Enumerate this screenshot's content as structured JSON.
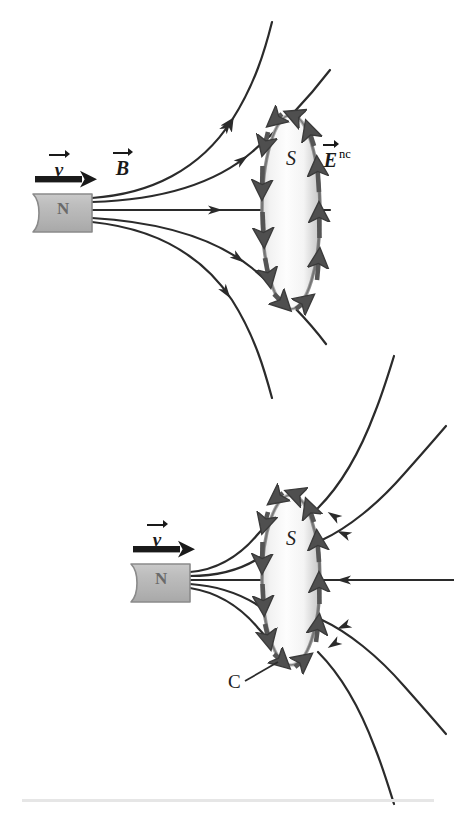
{
  "figure": {
    "background_color": "#ffffff",
    "ink_color": "#2b2b2b",
    "arrow_gray": "#5a5a5a",
    "magnet_fill": "#b8b8b8",
    "magnet_stroke": "#8a8a8a",
    "surface_fill_light": "#fbfbfb",
    "surface_fill_mid": "#e3e3e3",
    "surface_stroke": "#6f6f6f",
    "divider_color": "#e6e6e6"
  },
  "panels": [
    {
      "id": "top-panel",
      "name": "magnet-far-from-loop",
      "magnet": {
        "pole_label": "N",
        "name": "bar-magnet"
      },
      "velocity": {
        "symbol": "v",
        "has_vector_arrow": true,
        "direction": "right",
        "name": "velocity-label"
      },
      "field_label": {
        "symbol": "B",
        "has_vector_arrow": true,
        "name": "magnetic-field-label"
      },
      "induced_field_label": {
        "symbol": "E",
        "subscript": "nc",
        "has_vector_arrow": true,
        "name": "induced-electric-field-label"
      },
      "surface_label": {
        "text": "S",
        "name": "surface-label"
      },
      "loop_label": null,
      "description": "Magnet moving right with velocity v; magnetic field lines B spread outward and pass through flat surface S; induced non-conservative electric field E_nc circulates counterclockwise around the loop boundary."
    },
    {
      "id": "bottom-panel",
      "name": "magnet-near-loop",
      "magnet": {
        "pole_label": "N",
        "name": "bar-magnet"
      },
      "velocity": {
        "symbol": "v",
        "has_vector_arrow": true,
        "direction": "right",
        "name": "velocity-label"
      },
      "field_label": null,
      "induced_field_label": null,
      "surface_label": {
        "text": "S",
        "name": "surface-label"
      },
      "loop_label": {
        "text": "C",
        "name": "loop-boundary-label"
      },
      "description": "Magnet has moved closer; field lines converge through surface S and fan out beyond it; induced electric field arrows circulate counterclockwise around boundary curve C."
    }
  ]
}
